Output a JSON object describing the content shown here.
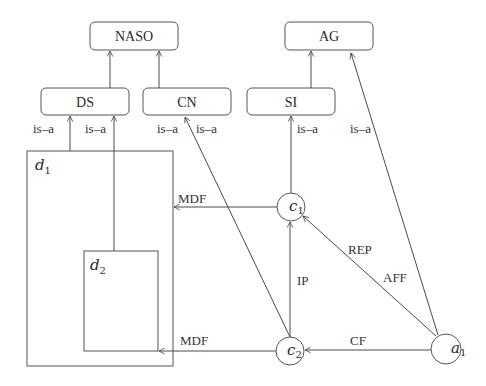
{
  "diagram": {
    "concepts": {
      "naso": "NASO",
      "ag": "AG",
      "ds": "DS",
      "cn": "CN",
      "si": "SI"
    },
    "containers": {
      "d1": {
        "var": "d",
        "sub": "1"
      },
      "d2": {
        "var": "d",
        "sub": "2"
      }
    },
    "nodes": {
      "c1": {
        "var": "c",
        "sub": "1"
      },
      "c2": {
        "var": "c",
        "sub": "2"
      },
      "a1": {
        "var": "a",
        "sub": "1"
      }
    },
    "edge_labels": {
      "d1_is_a_ds": "is–a",
      "d2_is_a_ds": "is–a",
      "c2_is_a_cn": "is–a",
      "c1_is_a_cn": "is–a",
      "c1_is_a_si": "is–a",
      "a1_is_a_ag": "is–a",
      "c1_mdf_d1": "MDF",
      "c2_mdf_d2": "MDF",
      "c2_ip_c1": "IP",
      "a1_rep_c1": "REP",
      "a1_aff_c1": "AFF",
      "a1_cf_c2": "CF"
    }
  }
}
